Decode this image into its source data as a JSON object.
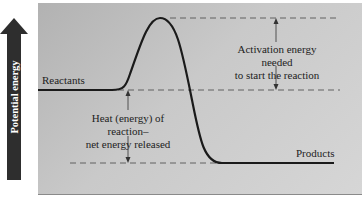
{
  "diagram": {
    "axis_label": "Potential energy",
    "labels": {
      "reactants": "Reactants",
      "products": "Products",
      "activation_line1": "Activation energy needed",
      "activation_line2": "to start the reaction",
      "heat_line1": "Heat (energy) of reaction–",
      "heat_line2": "net energy released"
    },
    "colors": {
      "arrow": "#2e2e2e",
      "curve": "#1a1a1a",
      "panel": "#c4c4c4",
      "dashed": "#555555"
    }
  }
}
